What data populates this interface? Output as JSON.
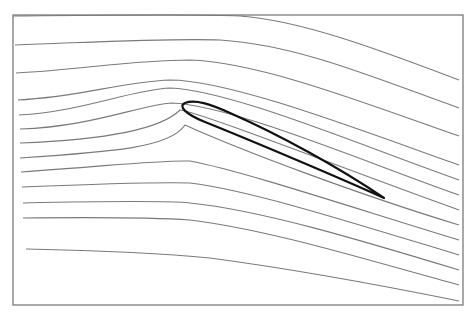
{
  "figure": {
    "frame": {
      "x": 13,
      "y": 15,
      "width": 450,
      "height": 290,
      "color": "#6e6e6e"
    },
    "streamline_color": "#7a7a7a",
    "airfoil_color": "#111111",
    "streamlines": [
      "M13,16 C120,15 200,14 240,16 C300,20 380,50 459,80",
      "M15,45 C100,42 170,38 220,40 C300,45 380,80 459,108",
      "M16,73 C80,70 130,60 190,60 C260,62 370,105 459,136",
      "M18,100 C80,97 120,82 170,80 C230,80 360,130 459,165",
      "M19,115 C80,112 130,90 170,88 C230,90 360,145 459,180",
      "M20,129 C90,127 140,105 172,103 C230,105 360,160 459,195",
      "M20,143 C100,140 160,130 180,110 C200,112 360,175 459,210",
      "M20,158 C110,152 170,148 185,125 C240,150 360,195 459,225",
      "M21,172 C120,165 160,160 190,161 C240,170 360,210 459,240",
      "M22,187 C120,183 160,182 190,183 C250,190 360,225 459,255",
      "M23,203 C120,201 170,201 190,203 C260,210 360,240 459,270",
      "M23,218 C120,217 160,218 190,220 C270,230 360,258 459,285",
      "M26,249 C120,251 180,255 210,258 C300,270 380,285 459,301"
    ],
    "airfoil_path": "M384,198 C340,178 250,140 205,122 C185,114 178,106 185,103 C195,99 210,104 230,113 C280,135 340,168 384,198 Z"
  },
  "caption": {
    "text": "",
    "note": "caption text cropped at bottom edge, not legible"
  }
}
